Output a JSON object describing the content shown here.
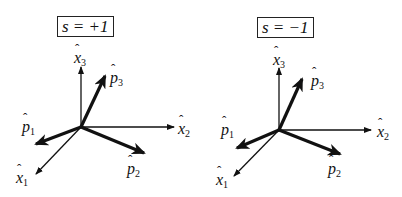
{
  "panels": [
    {
      "sign_label": "s = +1",
      "axes": {
        "x1": "x",
        "x2": "x",
        "x3": "x",
        "x1_sub": "1",
        "x2_sub": "2",
        "x3_sub": "3"
      },
      "vectors": {
        "p1": "p",
        "p2": "p",
        "p3": "p",
        "p1_sub": "1",
        "p2_sub": "2",
        "p3_sub": "3"
      }
    },
    {
      "sign_label": "s = −1",
      "axes": {
        "x1": "x",
        "x2": "x",
        "x3": "x",
        "x1_sub": "1",
        "x2_sub": "2",
        "x3_sub": "3"
      },
      "vectors": {
        "p1": "p",
        "p2": "p",
        "p3": "p",
        "p1_sub": "1",
        "p2_sub": "2",
        "p3_sub": "3"
      }
    }
  ],
  "hat": "ˆ"
}
